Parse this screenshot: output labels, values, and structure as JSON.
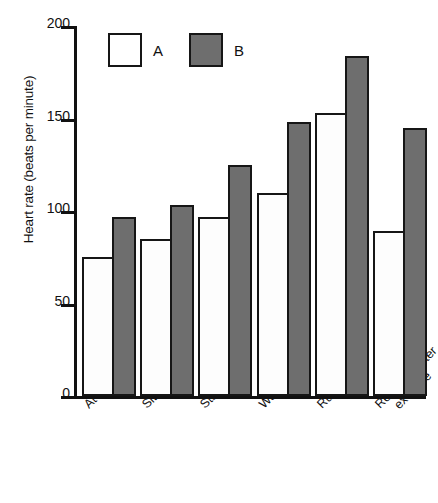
{
  "chart_data": {
    "type": "bar",
    "title": "",
    "xlabel": "",
    "ylabel": "Heart rate (beats per minute)",
    "ylim": [
      0,
      200
    ],
    "yticks": [
      "0",
      "50",
      "100",
      "150",
      "200"
    ],
    "grid": false,
    "legend_position": "top-left",
    "categories": [
      "At rest",
      "Sitting",
      "Standing",
      "Walking",
      "Running",
      "Recovery after exercise"
    ],
    "series": [
      {
        "name": "A",
        "color": "#ffffff",
        "values": [
          75,
          85,
          97,
          110,
          153,
          89
        ]
      },
      {
        "name": "B",
        "color": "#6e6e6e",
        "values": [
          97,
          103,
          125,
          148,
          184,
          145
        ]
      }
    ]
  },
  "axis": {
    "y_title": "Heart rate (beats per minute)",
    "y_ticks": [
      {
        "value": 200,
        "label": "200"
      },
      {
        "value": 150,
        "label": "150"
      },
      {
        "value": 100,
        "label": "100"
      },
      {
        "value": 50,
        "label": "50"
      },
      {
        "value": 0,
        "label": "0"
      }
    ]
  },
  "legend": {
    "items": [
      {
        "label": "A",
        "swatch": "white-square-outline"
      },
      {
        "label": "B",
        "swatch": "grey-filled-square"
      }
    ]
  },
  "x_labels": [
    {
      "line1": "At rest",
      "line2": ""
    },
    {
      "line1": "Sitting",
      "line2": ""
    },
    {
      "line1": "Standing",
      "line2": ""
    },
    {
      "line1": "Walking",
      "line2": ""
    },
    {
      "line1": "Running",
      "line2": ""
    },
    {
      "line1": "Recovery after",
      "line2": "exercise"
    }
  ]
}
